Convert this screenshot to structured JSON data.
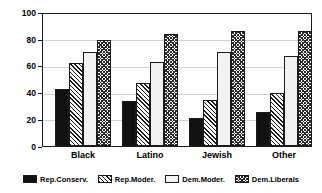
{
  "chart_data": {
    "type": "bar",
    "title": "",
    "subtitle": "",
    "xlabel": "",
    "ylabel": "",
    "categories": [
      "Black",
      "Latino",
      "Jewish",
      "Other"
    ],
    "series": [
      {
        "name": "Rep.Conserv.",
        "pattern": "solid-black",
        "values": [
          43,
          34,
          21,
          26
        ]
      },
      {
        "name": "Rep.Moder.",
        "pattern": "diagonal-hatch",
        "values": [
          63,
          48,
          35,
          40
        ]
      },
      {
        "name": "Dem.Moder.",
        "pattern": "empty-light",
        "values": [
          71,
          64,
          71,
          68
        ]
      },
      {
        "name": "Dem.Liberals",
        "pattern": "crosshatch",
        "values": [
          80,
          85,
          87,
          87
        ]
      }
    ],
    "ylim": [
      0,
      100
    ],
    "yticks": [
      0,
      20,
      40,
      60,
      80,
      100
    ],
    "ytick_labels": [
      "0",
      "20",
      "40",
      "60",
      "80",
      "100"
    ],
    "grid": true,
    "grid_axis": "y",
    "legend_position": "bottom",
    "colors": {
      "axis": "#1a1a1a",
      "grid": "#d2d2d2",
      "text": "#000000",
      "background": "#ffffff",
      "bar_outline": "#1a1a1a",
      "solid_fill": "#111111",
      "empty_fill": "#f2f2f2"
    }
  }
}
